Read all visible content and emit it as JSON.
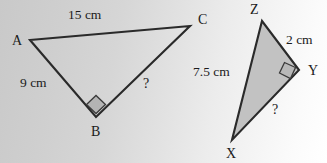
{
  "figure": {
    "background_left_color": "#c9c9c9",
    "background_right_color": "#ffffff",
    "stroke_color": "#2a2a2a",
    "fill_color": "#c2c2c2",
    "triangles": [
      {
        "id": "ABC",
        "filled": false,
        "vertices": [
          {
            "name": "A",
            "label": "A",
            "x": 30,
            "y": 40,
            "label_x": 12,
            "label_y": 45
          },
          {
            "name": "C",
            "label": "C",
            "x": 190,
            "y": 26,
            "label_x": 198,
            "label_y": 24
          },
          {
            "name": "B",
            "label": "B",
            "x": 96,
            "y": 117,
            "label_x": 91,
            "label_y": 136
          }
        ],
        "sides": [
          {
            "from": "A",
            "to": "C",
            "label": "15 cm",
            "label_x": 68,
            "label_y": 19
          },
          {
            "from": "A",
            "to": "B",
            "label": "9 cm",
            "label_x": 20,
            "label_y": 87
          },
          {
            "from": "B",
            "to": "C",
            "label": "?",
            "label_x": 143,
            "label_y": 88
          }
        ],
        "right_angle_at": "B"
      },
      {
        "id": "XYZ",
        "filled": true,
        "vertices": [
          {
            "name": "Z",
            "label": "Z",
            "x": 262,
            "y": 21,
            "label_x": 250,
            "label_y": 14
          },
          {
            "name": "Y",
            "label": "Y",
            "x": 299,
            "y": 70,
            "label_x": 308,
            "label_y": 75
          },
          {
            "name": "X",
            "label": "X",
            "x": 232,
            "y": 140,
            "label_x": 226,
            "label_y": 158
          }
        ],
        "sides": [
          {
            "from": "Z",
            "to": "Y",
            "label": "2 cm",
            "label_x": 286,
            "label_y": 44
          },
          {
            "from": "X",
            "to": "Z",
            "label": "7.5 cm",
            "label_x": 193,
            "label_y": 76
          },
          {
            "from": "X",
            "to": "Y",
            "label": "?",
            "label_x": 272,
            "label_y": 114
          }
        ],
        "right_angle_at": "Y"
      }
    ]
  }
}
